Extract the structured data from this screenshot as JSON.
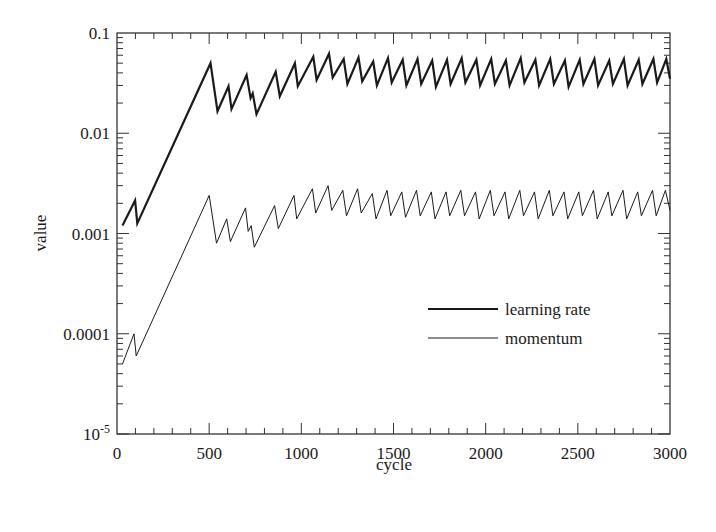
{
  "chart_data": {
    "type": "line",
    "title": "",
    "xlabel": "cycle",
    "ylabel": "value",
    "xlim": [
      0,
      3000
    ],
    "ylim": [
      1e-05,
      0.1
    ],
    "yscale": "log",
    "grid": false,
    "legend_position": "center-right",
    "x_ticks": [
      0,
      500,
      1000,
      1500,
      2000,
      2500,
      3000
    ],
    "x_tick_labels": [
      "0",
      "500",
      "1000",
      "1500",
      "2000",
      "2500",
      "3000"
    ],
    "y_ticks": [
      1e-05,
      0.0001,
      0.001,
      0.01,
      0.1
    ],
    "y_tick_labels": [
      "10^-5",
      "0.0001",
      "0.001",
      "0.01",
      "0.1"
    ],
    "series": [
      {
        "name": "learning rate",
        "style": "thick",
        "x": [
          30,
          98,
          110,
          507,
          545,
          605,
          621,
          703,
          725,
          736,
          757,
          861,
          883,
          965,
          981,
          1065,
          1083,
          1150,
          1170,
          1230,
          1250,
          1310,
          1330,
          1390,
          1410,
          1470,
          1490,
          1550,
          1570,
          1630,
          1650,
          1710,
          1730,
          1790,
          1810,
          1870,
          1890,
          1950,
          1970,
          2030,
          2050,
          2110,
          2130,
          2190,
          2210,
          2270,
          2290,
          2350,
          2370,
          2430,
          2450,
          2510,
          2530,
          2590,
          2610,
          2670,
          2690,
          2750,
          2770,
          2830,
          2850,
          2910,
          2930,
          2980,
          3000
        ],
        "values": [
          0.0012,
          0.00214,
          0.00126,
          0.05,
          0.0166,
          0.0295,
          0.0174,
          0.038,
          0.0224,
          0.025,
          0.0155,
          0.041,
          0.0234,
          0.05,
          0.0295,
          0.058,
          0.034,
          0.062,
          0.036,
          0.055,
          0.031,
          0.057,
          0.033,
          0.052,
          0.03,
          0.056,
          0.032,
          0.054,
          0.03,
          0.055,
          0.031,
          0.053,
          0.029,
          0.054,
          0.031,
          0.056,
          0.032,
          0.054,
          0.03,
          0.055,
          0.031,
          0.053,
          0.03,
          0.056,
          0.032,
          0.054,
          0.03,
          0.055,
          0.031,
          0.053,
          0.029,
          0.054,
          0.031,
          0.055,
          0.03,
          0.053,
          0.031,
          0.055,
          0.03,
          0.054,
          0.031,
          0.055,
          0.032,
          0.055,
          0.035
        ]
      },
      {
        "name": "momentum",
        "style": "thin",
        "x": [
          30,
          92,
          104,
          500,
          540,
          595,
          615,
          697,
          712,
          728,
          745,
          855,
          875,
          960,
          975,
          1060,
          1078,
          1145,
          1165,
          1225,
          1245,
          1305,
          1325,
          1385,
          1405,
          1465,
          1485,
          1545,
          1565,
          1625,
          1645,
          1705,
          1725,
          1785,
          1805,
          1865,
          1885,
          1945,
          1965,
          2025,
          2045,
          2105,
          2125,
          2185,
          2205,
          2265,
          2285,
          2345,
          2365,
          2425,
          2445,
          2505,
          2525,
          2585,
          2605,
          2665,
          2685,
          2745,
          2765,
          2825,
          2845,
          2905,
          2925,
          2975,
          3000
        ],
        "values": [
          5e-05,
          0.0001,
          6e-05,
          0.0024,
          0.0008,
          0.0014,
          0.00083,
          0.0018,
          0.00105,
          0.0012,
          0.00073,
          0.0019,
          0.00112,
          0.0024,
          0.0014,
          0.0028,
          0.0016,
          0.003,
          0.0017,
          0.0027,
          0.0015,
          0.0028,
          0.0016,
          0.0025,
          0.0014,
          0.0027,
          0.0015,
          0.0026,
          0.00145,
          0.0027,
          0.0015,
          0.0026,
          0.0014,
          0.0026,
          0.0015,
          0.0027,
          0.0015,
          0.0026,
          0.0014,
          0.0027,
          0.0015,
          0.0026,
          0.0014,
          0.0027,
          0.0015,
          0.0026,
          0.0014,
          0.0027,
          0.0015,
          0.0026,
          0.0014,
          0.0026,
          0.0015,
          0.0027,
          0.0014,
          0.0026,
          0.0015,
          0.0027,
          0.0014,
          0.0026,
          0.0015,
          0.0027,
          0.0015,
          0.0027,
          0.0017
        ]
      }
    ]
  },
  "colors": {
    "line": "#1a1a1a",
    "axis": "#333333",
    "background": "#ffffff"
  },
  "layout": {
    "plot_left": 117,
    "plot_right": 670,
    "plot_top": 33,
    "plot_bottom": 434
  }
}
